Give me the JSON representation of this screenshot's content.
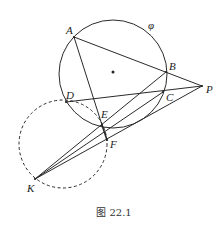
{
  "figure": {
    "caption": "图 22.1",
    "stroke_color": "#2a2a2a",
    "circle_label": "φ",
    "points": {
      "A": {
        "label": "A",
        "x": 74,
        "y": 37
      },
      "B": {
        "label": "B",
        "x": 166,
        "y": 72
      },
      "C": {
        "label": "C",
        "x": 163,
        "y": 92
      },
      "D": {
        "label": "D",
        "x": 66,
        "y": 102
      },
      "E": {
        "label": "E",
        "x": 102,
        "y": 125
      },
      "F": {
        "label": "F",
        "x": 107,
        "y": 140
      },
      "K": {
        "label": "K",
        "x": 35,
        "y": 179
      },
      "P": {
        "label": "P",
        "x": 202,
        "y": 86
      }
    },
    "circles": [
      {
        "name": "phi",
        "cx": 113,
        "cy": 74,
        "r": 54,
        "style": "solid"
      },
      {
        "name": "dashed",
        "cx": 63,
        "cy": 144,
        "r": 44,
        "style": "dashed"
      }
    ],
    "segments": [
      [
        "A",
        "P"
      ],
      [
        "A",
        "E"
      ],
      [
        "D",
        "P"
      ],
      [
        "K",
        "B"
      ],
      [
        "K",
        "C"
      ],
      [
        "K",
        "P"
      ],
      [
        "E",
        "F"
      ]
    ]
  }
}
